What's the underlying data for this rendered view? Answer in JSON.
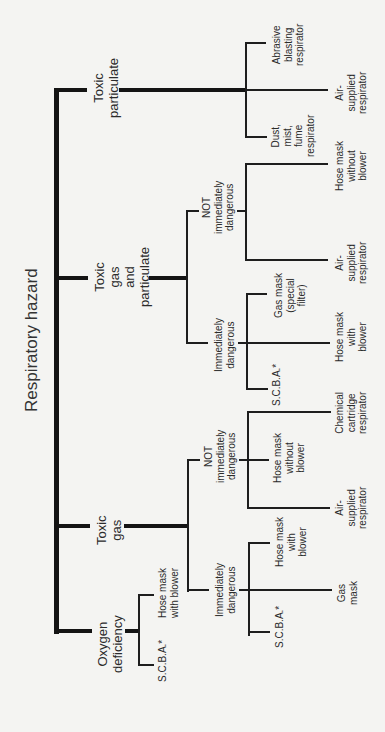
{
  "title": "Respiratory hazard",
  "footnote_marker": "*",
  "branches": [
    {
      "label": "Toxic\nparticulate",
      "children": [
        {
          "label": "Abrasive\nblasting\nrespirator"
        },
        {
          "label": "Air-\nsupplied\nrespirator"
        },
        {
          "label": "Dust,\nmist,\nfume\nrespirator"
        }
      ]
    },
    {
      "label": "Toxic\ngas\nand\nparticulate",
      "children": [
        {
          "label": "NOT\nimmediately\ndangerous",
          "children": [
            {
              "label": "Hose mask\nwithout\nblower"
            },
            {
              "label": "Air-\nsupplied\nrespirator"
            }
          ]
        },
        {
          "label": "Immediately\ndangerous",
          "children": [
            {
              "label": "Gas mask\n(special\nfilter)"
            },
            {
              "label": "Hose mask\nwith\nblower"
            },
            {
              "label": "S.C.B.A.*"
            }
          ]
        }
      ]
    },
    {
      "label": "Toxic\ngas",
      "children": [
        {
          "label": "NOT\nimmediately\ndangerous",
          "children": [
            {
              "label": "Chemical\ncartridge\nrespirator"
            },
            {
              "label": "Hose mask\nwithout\nblower"
            },
            {
              "label": "Air-\nsupplied\nrespirator"
            }
          ]
        },
        {
          "label": "Immediately\ndangerous",
          "children": [
            {
              "label": "Hose mask\nwith\nblower"
            },
            {
              "label": "Gas\nmask"
            },
            {
              "label": "S.C.B.A.*"
            }
          ]
        }
      ]
    },
    {
      "label": "Oxygen\ndeficiency",
      "children": [
        {
          "label": "Hose mask\nwith blower"
        },
        {
          "label": "S.C.B.A.*"
        }
      ]
    }
  ]
}
